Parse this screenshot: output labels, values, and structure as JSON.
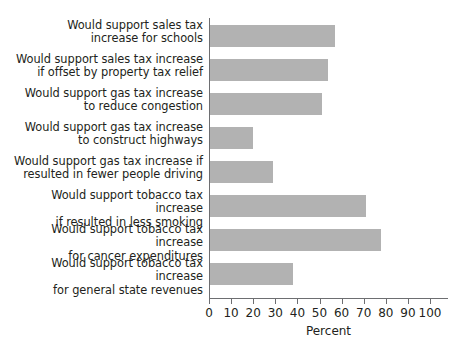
{
  "chart_data": {
    "type": "bar",
    "orientation": "horizontal",
    "title": "",
    "xlabel": "Percent",
    "ylabel": "",
    "xlim": [
      0,
      100
    ],
    "xticks": [
      0,
      10,
      20,
      30,
      40,
      50,
      60,
      70,
      80,
      90,
      100
    ],
    "grid": false,
    "legend": null,
    "bar_color": "#b2b2b2",
    "axis_color": "#6d6e71",
    "text_color": "#231f20",
    "categories": [
      "Would support sales tax\nincrease for schools",
      "Would support sales tax increase\nif offset by property tax relief",
      "Would support gas tax increase\nto reduce congestion",
      "Would support gas tax increase\nto construct highways",
      "Would support gas tax increase if\nresulted in fewer people driving",
      "Would support tobacco tax increase\nif resulted in less smoking",
      "Would support tobacco tax increase\nfor cancer expenditures",
      "Would support tobacco tax increase\nfor general state revenues"
    ],
    "values": [
      57,
      54,
      51,
      20,
      29,
      71,
      78,
      38
    ]
  },
  "axis": {
    "tick_labels": [
      "0",
      "10",
      "20",
      "30",
      "40",
      "50",
      "60",
      "70",
      "80",
      "90",
      "100"
    ],
    "title": "Percent"
  }
}
